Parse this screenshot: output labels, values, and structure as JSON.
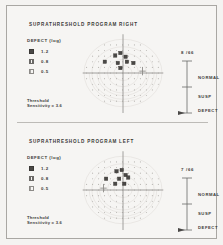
{
  "document": {
    "type": "perimetry-visual-field-printout"
  },
  "panels": [
    {
      "id": "right",
      "program_title": "SUPRATHRESHOLD PROGRAM",
      "eye": "RIGHT",
      "legend": {
        "title": "DEFECT (log)",
        "items": [
          {
            "symbol": "filled-square",
            "value": "1.2"
          },
          {
            "symbol": "hatched-square",
            "value": "0.8"
          },
          {
            "symbol": "light-square",
            "value": "0.5"
          }
        ]
      },
      "threshold": {
        "line1": "Threshold",
        "line2": "Sensitivity = 3.6"
      },
      "scale": {
        "count": "8 /66",
        "labels": [
          "NORMAL",
          "SUSP",
          "DEFECT"
        ]
      },
      "chart_data": {
        "type": "scatter",
        "title": "SUPRATHRESHOLD PROGRAM RIGHT",
        "xlabel": "",
        "ylabel": "",
        "xlim": [
          -30,
          30
        ],
        "ylim": [
          -30,
          30
        ],
        "grid": false,
        "legend_position": "left",
        "blind_spot": {
          "x": 15,
          "y": 1.5
        },
        "defects": [
          {
            "x": -6,
            "y": 14,
            "level": "1.2"
          },
          {
            "x": -2,
            "y": 16,
            "level": "1.2"
          },
          {
            "x": 2,
            "y": 13,
            "level": "1.2"
          },
          {
            "x": -14,
            "y": 9,
            "level": "1.2"
          },
          {
            "x": -4,
            "y": 8,
            "level": "1.2"
          },
          {
            "x": 3,
            "y": 9,
            "level": "1.2"
          },
          {
            "x": 8,
            "y": 8,
            "level": "1.2"
          },
          {
            "x": -2,
            "y": 4,
            "level": "1.2"
          }
        ]
      }
    },
    {
      "id": "left",
      "program_title": "SUPRATHRESHOLD PROGRAM",
      "eye": "LEFT",
      "legend": {
        "title": "DEFECT (log)",
        "items": [
          {
            "symbol": "filled-square",
            "value": "1.2"
          },
          {
            "symbol": "hatched-square",
            "value": "0.8"
          },
          {
            "symbol": "light-square",
            "value": "0.5"
          }
        ]
      },
      "threshold": {
        "line1": "Threshold",
        "line2": "Sensitivity = 3.6"
      },
      "scale": {
        "count": "7 /66",
        "labels": [
          "NORMAL",
          "SUSP",
          "DEFECT"
        ]
      },
      "chart_data": {
        "type": "scatter",
        "title": "SUPRATHRESHOLD PROGRAM LEFT",
        "xlabel": "",
        "ylabel": "",
        "xlim": [
          -30,
          30
        ],
        "ylim": [
          -30,
          30
        ],
        "grid": false,
        "legend_position": "left",
        "blind_spot": {
          "x": -15,
          "y": 1.5
        },
        "defects": [
          {
            "x": -5,
            "y": 15,
            "level": "1.2"
          },
          {
            "x": -1,
            "y": 16,
            "level": "1.2"
          },
          {
            "x": 2,
            "y": 12,
            "level": "1.2"
          },
          {
            "x": -13,
            "y": 9,
            "level": "1.2"
          },
          {
            "x": -3,
            "y": 9,
            "level": "1.2"
          },
          {
            "x": 4,
            "y": 10,
            "level": "1.2"
          },
          {
            "x": -6,
            "y": 5,
            "level": "1.2"
          },
          {
            "x": 1,
            "y": 5,
            "level": "1.2"
          }
        ]
      }
    }
  ],
  "colors": {
    "paper": "#f4f3f1",
    "ink": "#3b3a38",
    "marker": "#4a4846",
    "grid_dot": "#b8b6b2",
    "axis": "#8d8b88",
    "frame": "#a9a7a3"
  }
}
